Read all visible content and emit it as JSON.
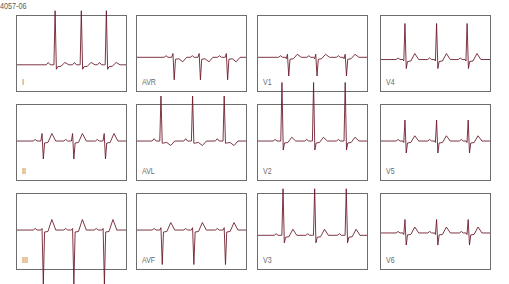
{
  "figure": {
    "id_label": "4057-06",
    "trace_color": "#6b1a2a",
    "border_color": "#6d6d6d",
    "label_color": "#6a6a6a"
  },
  "layout": {
    "columns_x": [
      16,
      136,
      257,
      380
    ],
    "rows_y": [
      15,
      104,
      193
    ],
    "panel_width": 111,
    "panel_height": 77
  },
  "leads": [
    {
      "label": "I",
      "row": 0,
      "col": 0,
      "baseline": 0.65,
      "beats": [
        0.35,
        0.59,
        0.82
      ],
      "r": 0.72,
      "s": 0.06,
      "q": 0.0,
      "t": 0.03,
      "t_sign": 1,
      "p": 0.03
    },
    {
      "label": "AVR",
      "row": 0,
      "col": 1,
      "baseline": 0.55,
      "beats": [
        0.33,
        0.57,
        0.82
      ],
      "r": 0.05,
      "s": 0.3,
      "q": 0.0,
      "t": 0.06,
      "t_sign": -1,
      "p": 0.02
    },
    {
      "label": "V1",
      "row": 0,
      "col": 2,
      "baseline": 0.55,
      "beats": [
        0.27,
        0.53,
        0.8
      ],
      "r": 0.04,
      "s": 0.25,
      "q": 0.02,
      "t": 0.04,
      "t_sign": 1,
      "p": 0.02
    },
    {
      "label": "V4",
      "row": 0,
      "col": 3,
      "baseline": 0.58,
      "beats": [
        0.22,
        0.51,
        0.79
      ],
      "r": 0.48,
      "s": 0.12,
      "q": 0.02,
      "t": 0.08,
      "t_sign": 1,
      "p": 0.02
    },
    {
      "label": "II",
      "row": 1,
      "col": 0,
      "baseline": 0.48,
      "beats": [
        0.23,
        0.51,
        0.8
      ],
      "r": 0.1,
      "s": 0.24,
      "q": 0.0,
      "t": 0.1,
      "t_sign": 1,
      "p": 0.02
    },
    {
      "label": "AVL",
      "row": 1,
      "col": 1,
      "baseline": 0.48,
      "beats": [
        0.22,
        0.51,
        0.8
      ],
      "r": 0.6,
      "s": 0.03,
      "q": 0.0,
      "t": 0.06,
      "t_sign": -1,
      "p": 0.03
    },
    {
      "label": "V2",
      "row": 1,
      "col": 2,
      "baseline": 0.48,
      "beats": [
        0.22,
        0.51,
        0.8
      ],
      "r": 0.78,
      "s": 0.12,
      "q": 0.0,
      "t": 0.05,
      "t_sign": 1,
      "p": 0.02
    },
    {
      "label": "V5",
      "row": 1,
      "col": 3,
      "baseline": 0.48,
      "beats": [
        0.22,
        0.51,
        0.8
      ],
      "r": 0.28,
      "s": 0.16,
      "q": 0.02,
      "t": 0.07,
      "t_sign": 1,
      "p": 0.02
    },
    {
      "label": "III",
      "row": 2,
      "col": 0,
      "baseline": 0.48,
      "beats": [
        0.23,
        0.51,
        0.79
      ],
      "r": 0.02,
      "s": 0.72,
      "q": 0.0,
      "t": 0.14,
      "t_sign": 1,
      "p": 0.02
    },
    {
      "label": "AVF",
      "row": 2,
      "col": 1,
      "baseline": 0.48,
      "beats": [
        0.22,
        0.51,
        0.8
      ],
      "r": 0.03,
      "s": 0.46,
      "q": 0.0,
      "t": 0.1,
      "t_sign": 1,
      "p": 0.02
    },
    {
      "label": "V3",
      "row": 2,
      "col": 2,
      "baseline": 0.55,
      "beats": [
        0.23,
        0.52,
        0.81
      ],
      "r": 0.62,
      "s": 0.1,
      "q": 0.0,
      "t": 0.08,
      "t_sign": 1,
      "p": 0.02
    },
    {
      "label": "V6",
      "row": 2,
      "col": 3,
      "baseline": 0.52,
      "beats": [
        0.22,
        0.51,
        0.8
      ],
      "r": 0.18,
      "s": 0.16,
      "q": 0.02,
      "t": 0.08,
      "t_sign": 1,
      "p": 0.02
    }
  ]
}
